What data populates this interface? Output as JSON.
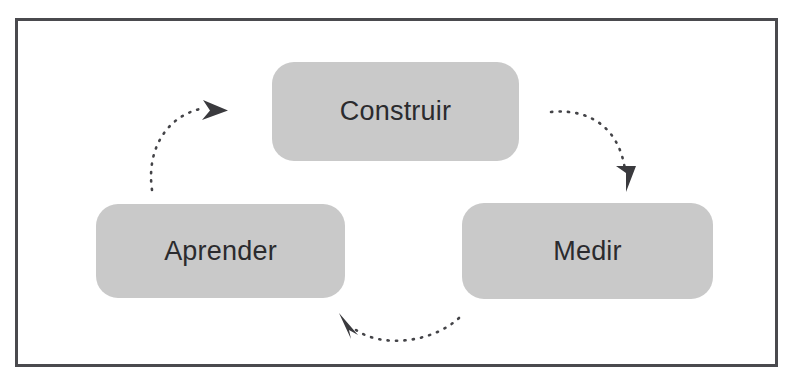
{
  "diagram": {
    "background_color": "#ffffff",
    "frame": {
      "border_color": "#4a4a4e",
      "border_width": 3
    },
    "node_style": {
      "fill_color": "#c9c9c9",
      "text_color": "#2b2b2e",
      "corner_radius": 22
    },
    "arrow_style": {
      "color": "#444448",
      "dash_pattern": "dotted",
      "head": "solid-triangle"
    },
    "nodes": [
      {
        "id": "construir",
        "label": "Construir",
        "position": "top-center"
      },
      {
        "id": "medir",
        "label": "Medir",
        "position": "right"
      },
      {
        "id": "aprender",
        "label": "Aprender",
        "position": "left"
      }
    ],
    "arrows": [
      {
        "id": "construir-to-medir",
        "from": "Construir",
        "to": "Medir",
        "direction": "down-right"
      },
      {
        "id": "medir-to-aprender",
        "from": "Medir",
        "to": "Aprender",
        "direction": "left"
      },
      {
        "id": "aprender-to-construir",
        "from": "Aprender",
        "to": "Construir",
        "direction": "up-right"
      }
    ]
  }
}
